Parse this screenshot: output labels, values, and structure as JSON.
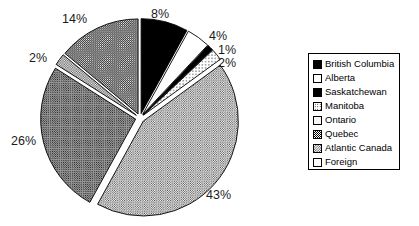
{
  "chart_data": {
    "type": "pie",
    "title": "",
    "categories": [
      "British Columbia",
      "Alberta",
      "Saskatchewan",
      "Manitoba",
      "Ontario",
      "Quebec",
      "Atlantic Canada",
      "Foreign"
    ],
    "values": [
      8,
      4,
      1,
      2,
      43,
      26,
      2,
      14
    ],
    "labels": [
      "8%",
      "4%",
      "1%",
      "2%",
      "43%",
      "26%",
      "2%",
      "14%"
    ],
    "exploded": true,
    "legend_position": "right",
    "grid": false,
    "patterns": [
      "solid-black",
      "white",
      "solid-black",
      "dots-light",
      "dots-fine",
      "check-dark",
      "check-med",
      "dots-med"
    ]
  },
  "labels": {
    "british_columbia": "8%",
    "alberta": "4%",
    "saskatchewan": "1%",
    "manitoba": "2%",
    "ontario": "43%",
    "quebec": "26%",
    "atlantic_canada": "2%",
    "foreign": "14%"
  },
  "legend": {
    "items": [
      {
        "label": "British Columbia"
      },
      {
        "label": "Alberta"
      },
      {
        "label": "Saskatchewan"
      },
      {
        "label": "Manitoba"
      },
      {
        "label": "Ontario"
      },
      {
        "label": "Quebec"
      },
      {
        "label": "Atlantic Canada"
      },
      {
        "label": "Foreign"
      }
    ]
  },
  "colors": {
    "outline": "#000000",
    "background": "#ffffff",
    "text": "#1a1a1a"
  }
}
